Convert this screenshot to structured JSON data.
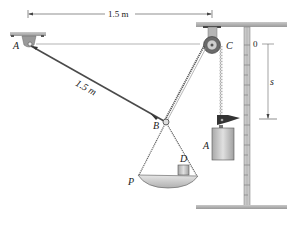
{
  "figure": {
    "type": "mechanics-diagram",
    "dimensions": {
      "horizontal_span": "1.5 m",
      "cable_AB": "1.5 m"
    },
    "points": {
      "A_support": "A",
      "B_ring": "B",
      "C_pulley": "C",
      "D_block": "D",
      "P_pan_edge": "P",
      "A_weight": "A"
    },
    "scale": {
      "zero_mark": "0",
      "position_variable": "s"
    },
    "colors": {
      "ceiling": "#b8b8b8",
      "cable": "#555555",
      "weight": "#c8c8c8",
      "pulley": "#7a7a7a",
      "flag": "#333333"
    }
  }
}
